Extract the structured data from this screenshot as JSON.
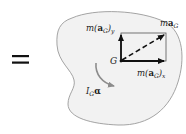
{
  "diagram": {
    "type": "kinetic-diagram",
    "equals_sign": "=",
    "colors": {
      "body_fill": "#f2f2f2",
      "body_stroke": "#9a9a9a",
      "vector": "#111111",
      "moment_arrow": "#8c8c8c",
      "rect": "#555555"
    },
    "point": {
      "label": "G"
    },
    "vectors": [
      {
        "name": "m(a_G)_y",
        "label_prefix": "m(",
        "label_bold": "a",
        "label_sub": "G",
        "label_suffix": ")",
        "label_sub2": "y",
        "direction": "up"
      },
      {
        "name": "m(a_G)_x",
        "label_prefix": "m(",
        "label_bold": "a",
        "label_sub": "G",
        "label_suffix": ")",
        "label_sub2": "x",
        "direction": "right"
      },
      {
        "name": "ma_G",
        "label_prefix": "m",
        "label_bold": "a",
        "label_sub": "G",
        "direction": "diagonal",
        "style": "dashed"
      }
    ],
    "moment": {
      "label_main": "I",
      "label_sub": "G",
      "label_greek": "α",
      "direction": "clockwise"
    }
  }
}
